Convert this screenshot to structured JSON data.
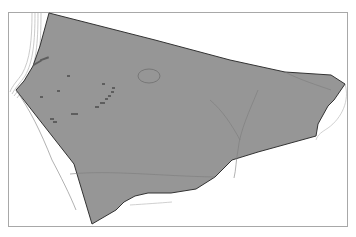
{
  "map": {
    "frame": {
      "x": 8,
      "y": 12,
      "width": 340,
      "height": 215,
      "stroke": "#a8a8a8"
    },
    "parcel": {
      "fill": "#969696",
      "stroke": "#333333",
      "points": "49,13 155,40 230,60 285,72 331,75 345,84 334,100 328,106 318,124 316,136 258,152 232,160 215,177 196,189 171,193 148,193 135,196 124,202 116,210 92,224 74,164 16,90 24,81 33,66 40,46"
    },
    "parcel_label": "Site parcel",
    "background": "#ffffff",
    "internal_lines_color": "#7c7c7c",
    "outer_contour_color": "#bdbdbd",
    "feature_marks_color": "#5e5e5e",
    "pond_outline_color": "#6f6f6f"
  }
}
